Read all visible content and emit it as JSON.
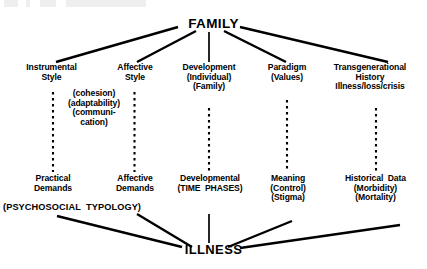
{
  "diagram": {
    "root": {
      "label": "FAMILY"
    },
    "bottom": {
      "label": "ILLNESS"
    },
    "columns": [
      {
        "id": "instrumental",
        "top_label": "Instrumental\nStyle",
        "bottom_label": "Practical\nDemands"
      },
      {
        "id": "affective",
        "top_label": "Affective\nStyle",
        "bottom_label": "Affective\nDemands"
      },
      {
        "id": "development",
        "top_label": "Development\n(Individual)\n(Family)",
        "bottom_label": "Developmental\n(TIME  PHASES)"
      },
      {
        "id": "paradigm",
        "top_label": "Paradigm\n(Values)",
        "bottom_label": "Meaning\n(Control)\n(Stigma)"
      },
      {
        "id": "transgenerational",
        "top_label": "Transgenerational\nHistory\nIllness/loss/crisis",
        "bottom_label": "Historical  Data\n(Morbidity)\n(Mortality)"
      }
    ],
    "annotations": {
      "style_parentheticals": "(cohesion)\n(adaptability)\n(communi-\ncation)",
      "psychosocial_typology": "(PSYCHOSOCIAL  TYPOLOGY)"
    },
    "colors": {
      "ink": "#000000",
      "background": "#ffffff"
    }
  }
}
